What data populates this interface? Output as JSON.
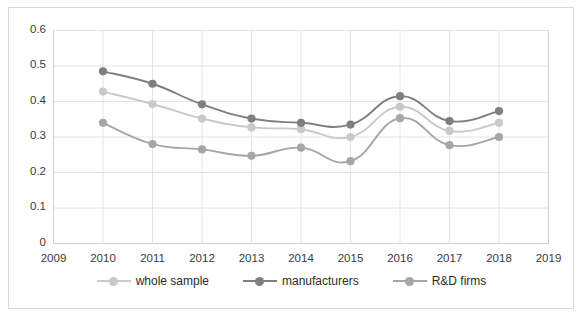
{
  "chart_data": {
    "type": "line",
    "title": "",
    "subtitle": "",
    "xlabel": "",
    "ylabel": "",
    "x": [
      2010,
      2011,
      2012,
      2013,
      2014,
      2015,
      2016,
      2017,
      2018
    ],
    "xlim": [
      2009,
      2019
    ],
    "ylim": [
      0,
      0.6
    ],
    "grid": true,
    "legend_position": "bottom",
    "x_tick_labels": [
      "2009",
      "2010",
      "2011",
      "2012",
      "2013",
      "2014",
      "2015",
      "2016",
      "2017",
      "2018",
      "2019"
    ],
    "y_tick_labels": [
      "0",
      "0.1",
      "0.2",
      "0.3",
      "0.4",
      "0.5",
      "0.6"
    ],
    "y_tick_values": [
      0,
      0.1,
      0.2,
      0.3,
      0.4,
      0.5,
      0.6
    ],
    "series": [
      {
        "name": "whole sample",
        "color": "#c9c9c9",
        "values": [
          0.428,
          0.393,
          0.352,
          0.327,
          0.322,
          0.3,
          0.385,
          0.317,
          0.34
        ]
      },
      {
        "name": "manufacturers",
        "color": "#7f7f7f",
        "values": [
          0.485,
          0.45,
          0.392,
          0.352,
          0.34,
          0.335,
          0.415,
          0.345,
          0.373
        ]
      },
      {
        "name": "R&D firms",
        "color": "#a6a6a6",
        "values": [
          0.34,
          0.28,
          0.265,
          0.247,
          0.27,
          0.232,
          0.353,
          0.277,
          0.3
        ]
      }
    ]
  },
  "legend": {
    "items": [
      {
        "label": "whole sample",
        "color": "#c9c9c9"
      },
      {
        "label": "manufacturers",
        "color": "#7f7f7f"
      },
      {
        "label": "R&D firms",
        "color": "#a6a6a6"
      }
    ]
  },
  "colors": {
    "whole_sample": "#c9c9c9",
    "manufacturers": "#7f7f7f",
    "rnd_firms": "#a6a6a6",
    "grid": "#e4e4e4",
    "axis": "#d0d0d0",
    "border": "#d9d9d9",
    "text": "#3b3b3b",
    "background": "#ffffff"
  }
}
